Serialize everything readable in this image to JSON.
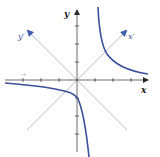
{
  "diagram": {
    "type": "rotated-axes-hyperbola",
    "colors": {
      "curve": "#3a4f9a",
      "axis": "#2b2b2b",
      "rotated_axis": "#b9bcc4",
      "rotated_arrow": "#3e5eb0",
      "label_dark": "#1a1a1a",
      "label_blue": "#3a4f9a"
    },
    "labels": {
      "x_axis": "x",
      "y_axis": "y",
      "x_prime_axis": "x′",
      "y_prime_axis": "y′",
      "tick_label": "−4"
    },
    "axes": {
      "origin_px": [
        77,
        80
      ],
      "unit_px": 18,
      "x_ticks": [
        -3,
        -2,
        -1,
        1,
        2,
        3
      ],
      "y_ticks": [
        -3,
        -2,
        -1,
        1,
        2,
        3
      ]
    },
    "rotation_angle_deg": 45,
    "branches": [
      {
        "name": "upper-right",
        "description": "descends from top near x≈1.2, approaches x-axis toward right"
      },
      {
        "name": "lower-left",
        "description": "from far left below x-axis, crosses y-axis near y≈−1, descends steeply near x≈0.6"
      }
    ]
  }
}
